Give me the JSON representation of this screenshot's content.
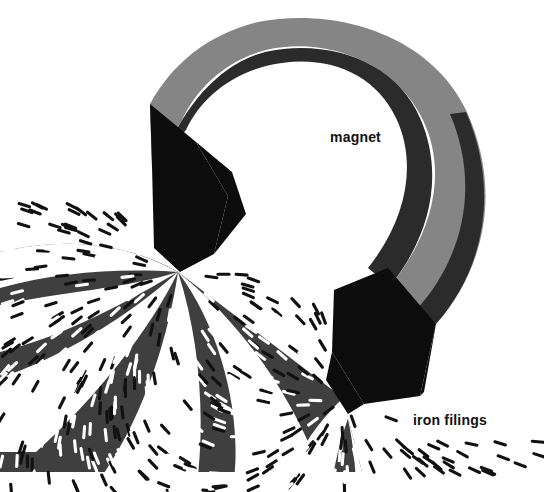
{
  "illustration": {
    "title": "Horseshoe magnet with iron filings",
    "subject": "magnetic field lines",
    "style": "mid-century flat vector illustration"
  },
  "labels": {
    "magnet": "magnet",
    "iron_filings": "iron filings"
  },
  "label_positions": {
    "magnet": {
      "x": 330,
      "y": 142
    },
    "iron_filings": {
      "x": 413,
      "y": 425
    }
  },
  "colors": {
    "background": "#ffffff",
    "field_region": "#3f3f3f",
    "magnet_body": "#858585",
    "magnet_shadow": "#2b2b2b",
    "pole_black": "#0c0c0c",
    "filing_dark": "#111111",
    "filing_light": "#ffffff",
    "label_text": "#111111"
  },
  "magnet": {
    "shape": "horseshoe",
    "body_color": "#858585",
    "inner_shadow_color": "#2b2b2b",
    "pole_count": 2,
    "poles": [
      {
        "name": "left-pole",
        "color": "#0c0c0c"
      },
      {
        "name": "right-pole",
        "color": "#0c0c0c"
      }
    ],
    "arch": {
      "outer_cx": 355,
      "outer_cy": 185,
      "outer_rx": 118,
      "outer_ry": 165,
      "inner_rx": 68,
      "inner_ry": 108
    }
  },
  "field": {
    "description": "Iron filings aligned along magnetic field lines radiating from both poles",
    "wedge_count": 7,
    "filing_count": 470,
    "filing_length": 11,
    "filing_thickness": 3.1,
    "pole_origins": [
      {
        "name": "left-pole-origin",
        "x": 178,
        "y": 272
      },
      {
        "name": "right-pole-origin",
        "x": 343,
        "y": 398
      }
    ]
  }
}
